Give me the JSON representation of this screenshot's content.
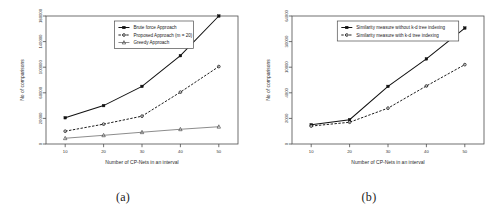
{
  "figure": {
    "panels": [
      {
        "caption": "(a)",
        "chart_key": "chart_a"
      },
      {
        "caption": "(b)",
        "chart_key": "chart_b"
      }
    ]
  },
  "chart_data": [
    {
      "id": "chart_a",
      "type": "line",
      "title": "",
      "xlabel": "Number of CP-Nets in an interval",
      "ylabel": "No of comparisons",
      "x": [
        10,
        20,
        30,
        40,
        50
      ],
      "xticks": [
        "10",
        "20",
        "30",
        "40",
        "50"
      ],
      "yticks": [
        "0",
        "20000",
        "60000",
        "100000",
        "140000",
        "180000"
      ],
      "ytickvals": [
        0,
        20000,
        60000,
        100000,
        140000,
        180000
      ],
      "xlim": [
        5,
        55
      ],
      "ylim": [
        0,
        195000
      ],
      "grid": false,
      "legend_position": "top-center",
      "series": [
        {
          "name": "Brute force Approach",
          "values": [
            21000,
            40000,
            70000,
            118000,
            180000
          ],
          "style": "solid",
          "marker": "square"
        },
        {
          "name": "Proposed Approach (m = 20)",
          "values": [
            10000,
            15500,
            23500,
            61000,
            101000
          ],
          "style": "dashed",
          "marker": "circle"
        },
        {
          "name": "Greedy Approach",
          "values": [
            4500,
            6800,
            9200,
            11500,
            13500
          ],
          "style": "thin",
          "marker": "triangle"
        }
      ]
    },
    {
      "id": "chart_b",
      "type": "line",
      "title": "",
      "xlabel": "Number of CP-Nets in an interval",
      "ylabel": "No of comparisons",
      "x": [
        10,
        20,
        30,
        40,
        50
      ],
      "xticks": [
        "10",
        "20",
        "30",
        "40",
        "50"
      ],
      "yticks": [
        "0",
        "2000",
        "4000",
        "10000",
        "30000",
        "64000"
      ],
      "ytickvals": [
        0,
        2000,
        4000,
        10000,
        30000,
        64000
      ],
      "xlim": [
        5,
        55
      ],
      "ylim": [
        0,
        72000
      ],
      "grid": false,
      "legend_position": "top-center",
      "series": [
        {
          "name": "Similarity measure without k-d tree indexing",
          "values": [
            1500,
            1900,
            5500,
            16500,
            48000
          ],
          "style": "solid",
          "marker": "square"
        },
        {
          "name": "Similarity measure with k-d tree indexing",
          "values": [
            1400,
            1700,
            2800,
            5600,
            12000
          ],
          "style": "dashed",
          "marker": "circle"
        }
      ]
    }
  ]
}
